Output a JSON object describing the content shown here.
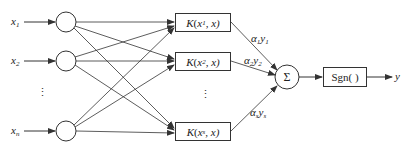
{
  "diagram": {
    "title": "",
    "type": "SVM network structure",
    "inputs": [
      {
        "name": "x",
        "sub": "1"
      },
      {
        "name": "x",
        "sub": "2"
      },
      {
        "name": "x",
        "sub": "n"
      }
    ],
    "input_ellipsis": "⋮",
    "kernels": [
      {
        "func": "K",
        "open": "(",
        "arg": "x",
        "sub": "1",
        "rest": ", x)"
      },
      {
        "func": "K",
        "open": "(",
        "arg": "x",
        "sub": "2",
        "rest": ", x)"
      },
      {
        "func": "K",
        "open": "(",
        "arg": "x",
        "sub": "s",
        "rest": ", x)"
      }
    ],
    "kernel_ellipsis": "⋮",
    "weights": [
      {
        "a": "α",
        "a_sub": "1",
        "y": "y",
        "y_sub": "1"
      },
      {
        "a": "α",
        "a_sub": "2",
        "y": "y",
        "y_sub": "2"
      },
      {
        "a": "α",
        "a_sub": "s",
        "y": "y",
        "y_sub": "s"
      }
    ],
    "sum_symbol": "Σ",
    "sign_label": "Sgn( )",
    "output_label": "y",
    "colors": {
      "line": "#333333",
      "text": "#222222",
      "background": "#ffffff"
    }
  }
}
